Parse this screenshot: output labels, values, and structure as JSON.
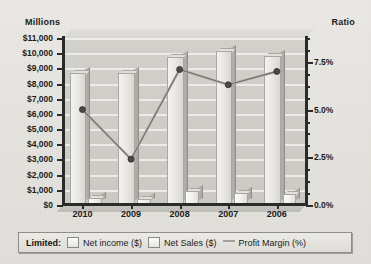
{
  "chart_data": {
    "type": "bar",
    "title": "",
    "subtitle": "",
    "xlabel": "",
    "ylabel": "Millions",
    "y2label": "Ratio",
    "categories": [
      "2010",
      "2009",
      "2008",
      "2007",
      "2006"
    ],
    "ylim": [
      0,
      11000
    ],
    "y2lim": [
      0,
      8.75
    ],
    "yticks": [
      "$0",
      "$1,000",
      "$2,000",
      "$3,000",
      "$4,000",
      "$5,000",
      "$6,000",
      "$7,000",
      "$8,000",
      "$9,000",
      "$10,000",
      "$11,000"
    ],
    "ytick_values": [
      0,
      1000,
      2000,
      3000,
      4000,
      5000,
      6000,
      7000,
      8000,
      9000,
      10000,
      11000
    ],
    "y2ticks": [
      "0.0%",
      "2.5%",
      "5.0%",
      "7.5%"
    ],
    "y2tick_values": [
      0,
      2.5,
      5.0,
      7.5
    ],
    "grid": true,
    "legend_position": "bottom",
    "series": [
      {
        "name": "Net income ($)",
        "axis": "left",
        "kind": "bar",
        "values": [
          420,
          310,
          850,
          720,
          680
        ]
      },
      {
        "name": "Net Sales ($)",
        "axis": "left",
        "kind": "bar",
        "values": [
          8600,
          8600,
          9700,
          10050,
          9750
        ]
      },
      {
        "name": "Profit Margin (%)",
        "axis": "right",
        "kind": "line",
        "values": [
          5.0,
          2.4,
          7.1,
          6.3,
          7.0
        ]
      }
    ]
  },
  "axes": {
    "left_caption": "Millions",
    "right_caption": "Ratio"
  },
  "legend": {
    "title": "Limited:",
    "items": [
      {
        "label": "Net income ($)",
        "swatch": "square-light",
        "color": "#f1f0ed"
      },
      {
        "label": "Net Sales ($)",
        "swatch": "square-light",
        "color": "#e9e8e4"
      },
      {
        "label": "Profit Margin (%)",
        "swatch": "line-marker",
        "color": "#a3a19c"
      }
    ]
  }
}
